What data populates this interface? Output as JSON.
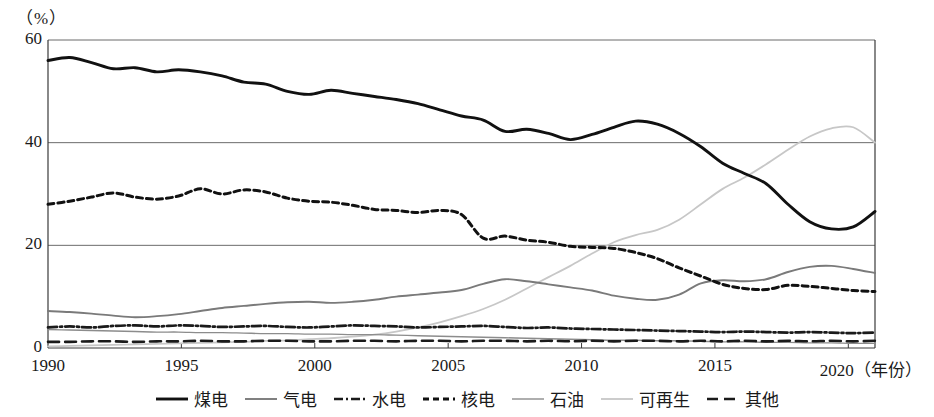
{
  "chart_data": {
    "type": "line",
    "title": "",
    "xlabel": "年份",
    "ylabel": "%",
    "unit_label": "（%）",
    "x_axis_suffix": "（年份）",
    "xlim": [
      1990,
      2021
    ],
    "ylim": [
      0,
      60
    ],
    "grid": true,
    "gridlines_y": [
      20,
      40,
      60
    ],
    "xticks": [
      "1990",
      "1995",
      "2000",
      "2005",
      "2010",
      "2015",
      "2020"
    ],
    "xtick_values": [
      1990,
      1995,
      2000,
      2005,
      2010,
      2015,
      2020
    ],
    "yticks": [
      "0",
      "20",
      "40",
      "60"
    ],
    "ytick_values": [
      0,
      20,
      40,
      60
    ],
    "legend_position": "bottom",
    "x": [
      1990,
      1991,
      1992,
      1993,
      1994,
      1995,
      1996,
      1997,
      1998,
      1999,
      2000,
      2001,
      2002,
      2003,
      2004,
      2005,
      2006,
      2007,
      2008,
      2009,
      2010,
      2011,
      2012,
      2013,
      2014,
      2015,
      2016,
      2017,
      2018,
      2019,
      2020,
      2021
    ],
    "series": [
      {
        "name": "煤电",
        "key": "coal",
        "style": "solid-thick",
        "color": "#111111",
        "values": [
          56.0,
          56.6,
          55.6,
          54.4,
          54.6,
          53.8,
          54.2,
          53.8,
          53.0,
          51.8,
          51.4,
          50.0,
          49.4,
          50.2,
          49.6,
          49.0,
          48.4,
          47.6,
          46.4,
          45.2,
          44.4,
          42.2,
          42.6,
          41.8,
          40.6,
          41.6,
          43.0,
          44.2,
          43.6,
          41.8,
          39.2,
          36.0
        ],
        "values_tail": [
          34.0,
          32.0,
          28.0,
          24.6,
          23.2,
          23.6,
          26.6
        ],
        "notes": "Thick solid black line, starts ~56% in 1990, declines to ~23% around 2019-2020, rebounds to ~27%"
      },
      {
        "name": "气电",
        "key": "gas",
        "style": "solid-gray",
        "color": "#7a7a7a",
        "values": [
          7.2,
          7.0,
          6.7,
          6.3,
          6.0,
          6.2,
          6.6,
          7.2,
          7.8,
          8.2,
          8.6,
          8.9,
          9.0,
          8.8,
          9.0,
          9.4,
          10.0,
          10.4,
          10.8,
          11.3,
          12.5,
          13.4,
          13.0,
          12.4,
          11.8,
          11.2,
          10.2,
          9.6,
          9.4,
          10.4,
          12.6,
          13.2
        ],
        "values_tail": [
          13.0,
          13.4,
          14.8,
          15.8,
          16.0,
          15.4,
          14.6
        ],
        "notes": "Medium gray solid line, rises from ~7% to ~16% peak near 2019, ends ~14.6%"
      },
      {
        "name": "水电",
        "key": "hydro",
        "style": "dash-dot",
        "color": "#1a1a1a",
        "values": [
          4.0,
          4.2,
          4.0,
          4.3,
          4.4,
          4.2,
          4.4,
          4.3,
          4.1,
          4.2,
          4.3,
          4.1,
          4.0,
          4.2,
          4.4,
          4.3,
          4.2,
          4.0,
          4.1,
          4.2,
          4.3,
          4.1,
          3.9,
          4.0,
          3.8,
          3.7,
          3.6,
          3.5,
          3.4,
          3.3,
          3.2,
          3.1
        ],
        "values_tail": [
          3.2,
          3.1,
          3.0,
          3.1,
          3.0,
          2.9,
          3.0
        ],
        "notes": "Black dash-dot line, roughly flat around 3-4.5%"
      },
      {
        "name": "核电",
        "key": "nuclear",
        "style": "dotted-thick",
        "color": "#111111",
        "values": [
          28.0,
          28.6,
          29.4,
          30.2,
          29.4,
          29.0,
          29.6,
          31.0,
          30.0,
          30.8,
          30.4,
          29.2,
          28.6,
          28.4,
          27.8,
          27.0,
          26.8,
          26.4,
          26.8,
          26.0,
          21.4,
          21.8,
          21.0,
          20.6,
          19.8,
          19.6,
          19.4,
          18.6,
          17.4,
          15.6,
          14.0,
          12.4
        ],
        "values_tail": [
          11.6,
          11.4,
          12.2,
          12.0,
          11.6,
          11.2,
          11.0
        ],
        "notes": "Thick black dotted line, starts ~28%, peaks ~31% around 1997, declines to ~11%"
      },
      {
        "name": "石油",
        "key": "oil",
        "style": "solid-thin-gray",
        "color": "#8c8c8c",
        "values": [
          3.6,
          3.5,
          3.4,
          3.3,
          3.2,
          3.1,
          3.1,
          3.0,
          3.0,
          2.9,
          2.8,
          2.8,
          2.7,
          2.7,
          2.6,
          2.6,
          2.5,
          2.4,
          2.3,
          2.2,
          2.1,
          2.0,
          1.9,
          1.8,
          1.7,
          1.6,
          1.5,
          1.5,
          1.4,
          1.4,
          1.3,
          1.2
        ],
        "values_tail": [
          1.2,
          1.1,
          1.1,
          1.0,
          1.0,
          0.9,
          0.9
        ],
        "notes": "Thin gray line declining from ~3.6% to ~1%"
      },
      {
        "name": "可再生",
        "key": "renewable",
        "style": "solid-light",
        "color": "#c7c7c7",
        "values": [
          0.3,
          0.4,
          0.5,
          0.6,
          0.7,
          0.8,
          0.9,
          1.0,
          1.1,
          1.2,
          1.4,
          1.5,
          1.7,
          1.9,
          2.2,
          2.6,
          3.2,
          4.0,
          5.0,
          6.2,
          7.6,
          9.4,
          11.6,
          13.8,
          16.0,
          18.4,
          20.6,
          22.0,
          23.0,
          25.0,
          28.0,
          31.0
        ],
        "values_tail": [
          33.2,
          35.8,
          38.6,
          41.2,
          42.8,
          43.0,
          40.0
        ],
        "notes": "Very light gray line, near zero until ~2003, rises steeply, peaks ~43% near 2020, ends ~40%"
      },
      {
        "name": "其他",
        "key": "other",
        "style": "dashed-thick",
        "color": "#1a1a1a",
        "values": [
          1.2,
          1.2,
          1.3,
          1.3,
          1.2,
          1.3,
          1.3,
          1.4,
          1.3,
          1.3,
          1.4,
          1.4,
          1.3,
          1.3,
          1.4,
          1.4,
          1.3,
          1.4,
          1.4,
          1.3,
          1.4,
          1.4,
          1.3,
          1.4,
          1.3,
          1.4,
          1.3,
          1.4,
          1.4,
          1.3,
          1.4,
          1.3
        ],
        "values_tail": [
          1.4,
          1.3,
          1.4,
          1.3,
          1.4,
          1.3,
          1.4
        ],
        "notes": "Thick black dashed line, flat near 1.3%"
      }
    ]
  },
  "legend": {
    "items": [
      {
        "label": "煤电",
        "swatch": "solid-thick",
        "color": "#111111"
      },
      {
        "label": "气电",
        "swatch": "solid-gray",
        "color": "#7a7a7a"
      },
      {
        "label": "水电",
        "swatch": "dash-dot",
        "color": "#1a1a1a"
      },
      {
        "label": "核电",
        "swatch": "dotted-thick",
        "color": "#111111"
      },
      {
        "label": "石油",
        "swatch": "solid-thin-gray",
        "color": "#8c8c8c"
      },
      {
        "label": "可再生",
        "swatch": "solid-light",
        "color": "#c7c7c7"
      },
      {
        "label": "其他",
        "swatch": "dashed-thick",
        "color": "#1a1a1a"
      }
    ]
  },
  "colors": {
    "axis": "#3a3a3a",
    "grid": "#6b6b6b",
    "background": "#ffffff",
    "text": "#1a1a1a"
  }
}
